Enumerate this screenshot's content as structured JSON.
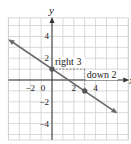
{
  "chart_data": {
    "type": "line",
    "title": "",
    "xlabel": "x",
    "ylabel": "y",
    "xlim": [
      -4,
      7
    ],
    "ylim": [
      -5.5,
      5.7
    ],
    "grid": true,
    "x_ticks": [
      "-2",
      "0",
      "2",
      "4"
    ],
    "y_ticks": [
      "4",
      "2",
      "-2",
      "-4"
    ],
    "series": [
      {
        "name": "line",
        "slope": -0.6667,
        "intercept": 1,
        "x": [
          -4,
          6
        ],
        "y": [
          3.67,
          -3
        ]
      }
    ],
    "points": [
      {
        "x": 0,
        "y": 1
      },
      {
        "x": 3,
        "y": -1
      }
    ],
    "annotations": [
      {
        "text": "right 3",
        "from": [
          0,
          1
        ],
        "to": [
          3,
          1
        ]
      },
      {
        "text": "down 2",
        "from": [
          3,
          1
        ],
        "to": [
          3,
          -1
        ]
      }
    ],
    "colors": {
      "line": "#6b6b6b",
      "grid": "#cfcfcf",
      "axis": "#333333",
      "point": "#555555"
    }
  }
}
